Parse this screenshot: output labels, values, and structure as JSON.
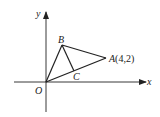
{
  "diagram": {
    "type": "coordinate-geometry",
    "axes": {
      "x_label": "x",
      "y_label": "y",
      "origin_label": "O"
    },
    "points": {
      "O": {
        "label": "O"
      },
      "A": {
        "label": "A",
        "coords_text": "(4,2)"
      },
      "B": {
        "label": "B"
      },
      "C": {
        "label": "C"
      }
    },
    "segments": [
      "OB",
      "BA",
      "OA",
      "BC"
    ],
    "colors": {
      "stroke": "#222222",
      "background": "#ffffff"
    }
  }
}
